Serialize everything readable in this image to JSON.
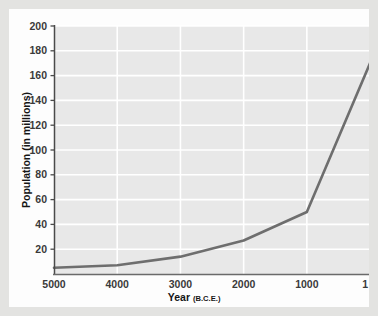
{
  "figure": {
    "background_color": "#e3e3e1",
    "card_color": "#fdfdfd",
    "plot_background_color": "#e8e8e8",
    "gridline_color": "#ffffff",
    "axis_color": "#4a4a4a",
    "line_color": "#6e6e6e"
  },
  "chart_data": {
    "type": "line",
    "title": "",
    "subtitle": "",
    "xlabel": "Year",
    "xlabel_suffix": "(B.C.E.)",
    "ylabel": "Population (in millions)",
    "x": [
      5000,
      4000,
      3000,
      2000,
      1000,
      1
    ],
    "values": [
      5,
      7,
      14,
      27,
      50,
      170
    ],
    "categories": [
      "5000",
      "4000",
      "3000",
      "2000",
      "1000",
      "1"
    ],
    "series": [
      {
        "name": "World population",
        "values": [
          5,
          7,
          14,
          27,
          50,
          170
        ]
      }
    ],
    "xtick_labels": [
      "5000",
      "4000",
      "3000",
      "2000",
      "1000",
      "1"
    ],
    "xtick_values": [
      5000,
      4000,
      3000,
      2000,
      1000,
      1
    ],
    "ytick_labels": [
      "20",
      "40",
      "60",
      "80",
      "100",
      "120",
      "140",
      "160",
      "180",
      "200"
    ],
    "ytick_values": [
      20,
      40,
      60,
      80,
      100,
      120,
      140,
      160,
      180,
      200
    ],
    "xlim": [
      5000,
      1
    ],
    "ylim": [
      0,
      200
    ],
    "x_axis_inverted": true,
    "grid": true,
    "grid_axes": "both",
    "legend": false,
    "legend_position": "none",
    "annotations": []
  }
}
